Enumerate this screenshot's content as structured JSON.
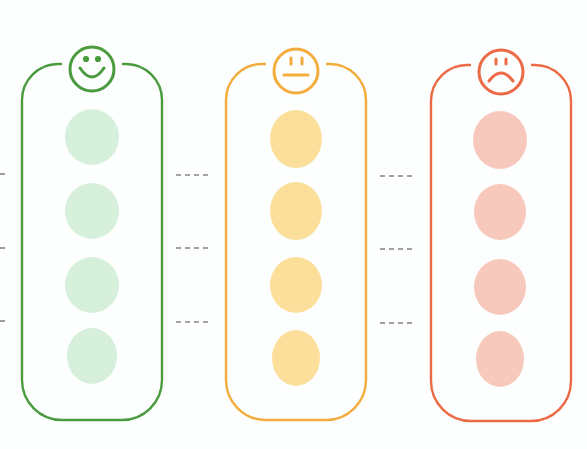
{
  "diagram": {
    "type": "sentiment-columns",
    "columns": [
      {
        "id": "positive",
        "face": "smiley-face",
        "stroke": "#4a9a3e",
        "fill": "#d6f0dc",
        "slots": 4
      },
      {
        "id": "neutral",
        "face": "neutral-face",
        "stroke": "#f2ad3e",
        "fill": "#fbdf9a",
        "slots": 4
      },
      {
        "id": "negative",
        "face": "frown-face",
        "stroke": "#ec6a45",
        "fill": "#f7c8bc",
        "slots": 4
      }
    ],
    "connector_color": "#8a7f8a",
    "connector_style": "dashed"
  }
}
